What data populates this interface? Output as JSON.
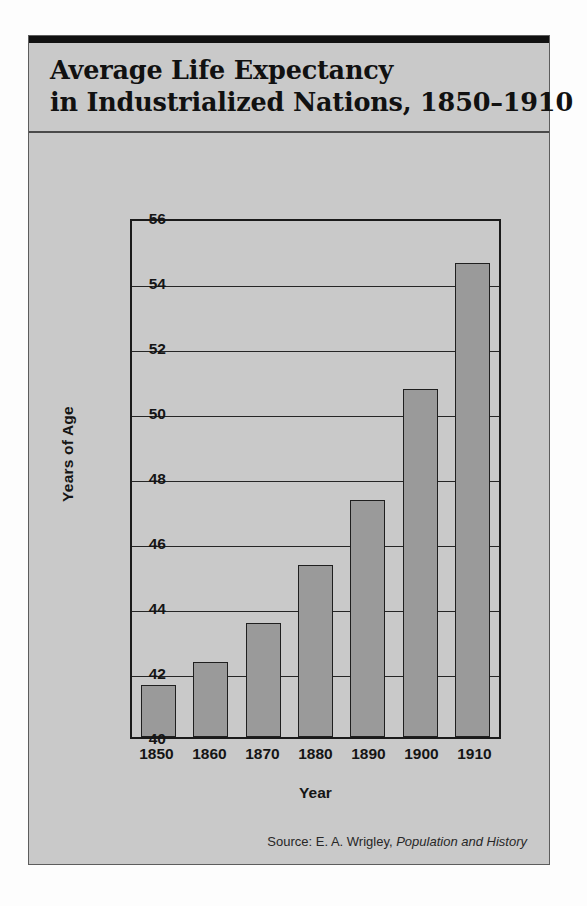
{
  "card": {
    "title_line_1": "Average Life Expectancy",
    "title_line_2": "in Industrialized Nations, 1850–1910"
  },
  "source": {
    "prefix": "Source:  E. A. Wrigley,",
    "book": "Population and History"
  },
  "colors": {
    "card_background": "#c9c9c9",
    "bar_fill": "#9a9a9a",
    "bar_stroke": "#1f1f1f",
    "axis": "#1a1a1a",
    "text": "#151515",
    "title_rule": "#111111"
  },
  "chart_data": {
    "type": "bar",
    "title": "Average Life Expectancy in Industrialized Nations, 1850–1910",
    "xlabel": "Year",
    "ylabel": "Years of Age",
    "categories": [
      "1850",
      "1860",
      "1870",
      "1880",
      "1890",
      "1900",
      "1910"
    ],
    "values": [
      41.6,
      42.3,
      43.5,
      45.3,
      47.3,
      50.7,
      54.6
    ],
    "ylim": [
      40,
      56
    ],
    "yticks": [
      40,
      42,
      44,
      46,
      48,
      50,
      52,
      54,
      56
    ],
    "ytick_labels": [
      "40",
      "42",
      "44",
      "46",
      "48",
      "50",
      "52",
      "54",
      "56"
    ],
    "grid": true,
    "legend": "none",
    "source_note": "Source:  E. A. Wrigley, Population and History"
  }
}
